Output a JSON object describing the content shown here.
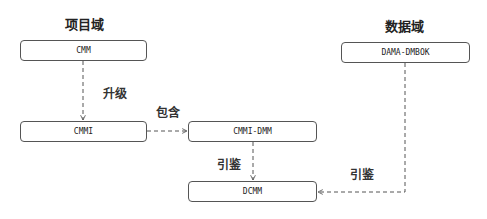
{
  "diagram": {
    "domains": {
      "project": "项目域",
      "data": "数据域"
    },
    "nodes": {
      "cmm": "CMM",
      "cmmi": "CMMI",
      "cmmi_dmm": "CMMI-DMM",
      "dcmm": "DCMM",
      "dama": "DAMA-DMBOK"
    },
    "edges": [
      {
        "from": "CMM",
        "to": "CMMI",
        "label": "升级",
        "style": "dashed"
      },
      {
        "from": "CMMI",
        "to": "CMMI-DMM",
        "label": "包含",
        "style": "dashed"
      },
      {
        "from": "CMMI-DMM",
        "to": "DCMM",
        "label": "引鉴",
        "style": "dashed"
      },
      {
        "from": "DAMA-DMBOK",
        "to": "DCMM",
        "label": "引鉴",
        "style": "dashed"
      }
    ],
    "colors": {
      "line": "#555555",
      "text": "#222222",
      "background": "#ffffff"
    }
  }
}
